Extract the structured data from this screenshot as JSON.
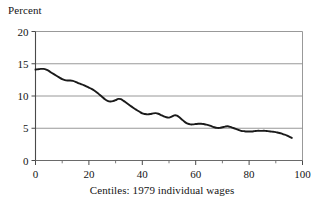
{
  "figure": {
    "ylabel_top": "Percent",
    "xcaption": "Centiles: 1979 individual wages"
  },
  "chart_data": {
    "type": "line",
    "title": "",
    "subtitle": "",
    "xlabel": "Centiles: 1979 individual wages",
    "ylabel": "Percent",
    "xlim": [
      0,
      100
    ],
    "ylim": [
      0,
      20
    ],
    "xticks": [
      0,
      20,
      40,
      60,
      80,
      100
    ],
    "xtick_labels": [
      "0",
      "20",
      "40",
      "60",
      "80",
      "100"
    ],
    "xminor_ticks": [
      10,
      30,
      50,
      70,
      90
    ],
    "yticks": [
      0,
      5,
      10,
      15,
      20
    ],
    "ytick_labels": [
      "0",
      "5",
      "10",
      "15",
      "20"
    ],
    "grid": "horizontal",
    "legend": "none",
    "line_color": "#1a1a1a",
    "line_width": 1.9,
    "series": [
      {
        "name": "Percent of individuals",
        "x": [
          0,
          1,
          2,
          3,
          4,
          5,
          6,
          7,
          8,
          9,
          10,
          11,
          12,
          13,
          14,
          15,
          16,
          17,
          18,
          19,
          20,
          21,
          22,
          23,
          24,
          25,
          26,
          27,
          28,
          29,
          30,
          31,
          32,
          33,
          34,
          35,
          36,
          37,
          38,
          39,
          40,
          41,
          42,
          43,
          44,
          45,
          46,
          47,
          48,
          49,
          50,
          51,
          52,
          53,
          54,
          55,
          56,
          57,
          58,
          59,
          60,
          61,
          62,
          63,
          64,
          65,
          66,
          67,
          68,
          69,
          70,
          71,
          72,
          73,
          74,
          75,
          76,
          77,
          78,
          79,
          80,
          81,
          82,
          83,
          84,
          85,
          86,
          87,
          88,
          89,
          90,
          91,
          92,
          93,
          94,
          95,
          96
        ],
        "values": [
          14.1,
          14.15,
          14.2,
          14.2,
          14.1,
          13.9,
          13.6,
          13.35,
          13.1,
          12.85,
          12.6,
          12.45,
          12.4,
          12.4,
          12.35,
          12.2,
          12.0,
          11.85,
          11.7,
          11.5,
          11.3,
          11.1,
          10.85,
          10.55,
          10.2,
          9.85,
          9.5,
          9.25,
          9.15,
          9.2,
          9.35,
          9.55,
          9.5,
          9.25,
          8.95,
          8.65,
          8.35,
          8.05,
          7.8,
          7.55,
          7.3,
          7.2,
          7.15,
          7.2,
          7.3,
          7.35,
          7.25,
          7.05,
          6.85,
          6.7,
          6.65,
          6.8,
          7.0,
          6.95,
          6.65,
          6.3,
          5.95,
          5.7,
          5.6,
          5.6,
          5.65,
          5.7,
          5.7,
          5.65,
          5.55,
          5.45,
          5.3,
          5.15,
          5.05,
          5.05,
          5.15,
          5.25,
          5.3,
          5.2,
          5.05,
          4.9,
          4.75,
          4.6,
          4.55,
          4.5,
          4.5,
          4.5,
          4.55,
          4.6,
          4.6,
          4.6,
          4.6,
          4.55,
          4.5,
          4.45,
          4.4,
          4.3,
          4.2,
          4.05,
          3.9,
          3.7,
          3.5
        ]
      }
    ]
  }
}
